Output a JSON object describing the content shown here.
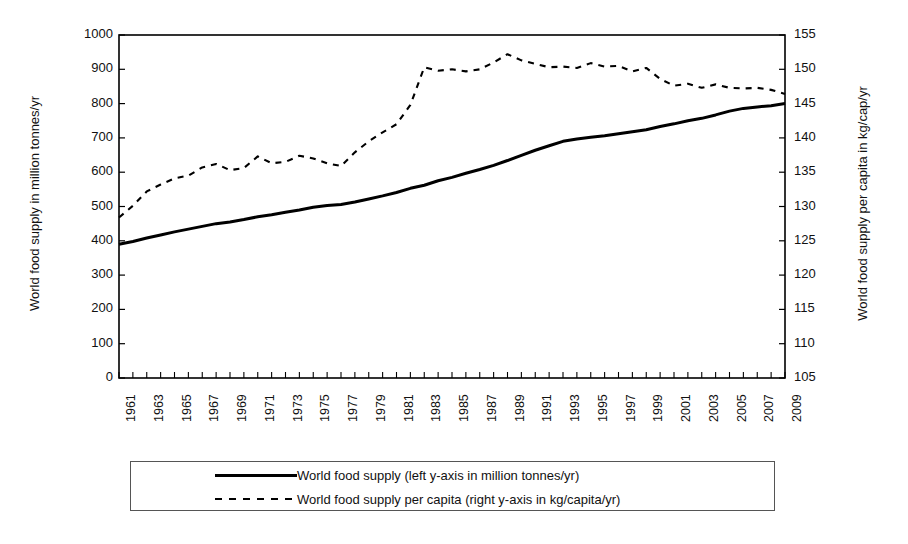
{
  "chart_data": {
    "type": "line",
    "title": "",
    "xlabel": "",
    "x": [
      1961,
      1962,
      1963,
      1964,
      1965,
      1966,
      1967,
      1968,
      1969,
      1970,
      1971,
      1972,
      1973,
      1974,
      1975,
      1976,
      1977,
      1978,
      1979,
      1980,
      1981,
      1982,
      1983,
      1984,
      1985,
      1986,
      1987,
      1988,
      1989,
      1990,
      1991,
      1992,
      1993,
      1994,
      1995,
      1996,
      1997,
      1998,
      1999,
      2000,
      2001,
      2002,
      2003,
      2004,
      2005,
      2006,
      2007,
      2008,
      2009
    ],
    "xtick_labels": [
      "1961",
      "1963",
      "1965",
      "1967",
      "1969",
      "1971",
      "1973",
      "1975",
      "1977",
      "1979",
      "1981",
      "1983",
      "1985",
      "1987",
      "1989",
      "1991",
      "1993",
      "1995",
      "1997",
      "1999",
      "2001",
      "2003",
      "2005",
      "2007",
      "2009"
    ],
    "xlim": [
      1961,
      2009
    ],
    "grid": false,
    "legend_position": "below-plot",
    "axes": [
      {
        "id": "left",
        "ylabel": "World food supply in million tonnes/yr",
        "ylim": [
          0,
          1000
        ],
        "yticks": [
          0,
          100,
          200,
          300,
          400,
          500,
          600,
          700,
          800,
          900,
          1000
        ]
      },
      {
        "id": "right",
        "ylabel": "World food supply per capita in kg/cap/yr",
        "ylim": [
          105,
          155
        ],
        "yticks": [
          105,
          110,
          115,
          120,
          125,
          130,
          135,
          140,
          145,
          150,
          155
        ]
      }
    ],
    "series": [
      {
        "name": "World food supply (left y-axis in million tonnes/yr)",
        "axis": "left",
        "style": "solid",
        "color": "#000000",
        "values": [
          390,
          398,
          408,
          417,
          426,
          434,
          442,
          450,
          455,
          462,
          470,
          476,
          483,
          490,
          498,
          503,
          506,
          513,
          522,
          531,
          541,
          553,
          562,
          575,
          585,
          597,
          608,
          620,
          634,
          649,
          664,
          677,
          690,
          697,
          702,
          706,
          712,
          718,
          724,
          733,
          741,
          750,
          757,
          767,
          778,
          786,
          790,
          794,
          800
        ]
      },
      {
        "name": "World food supply per capita (right y-axis in kg/capita/yr)",
        "axis": "right",
        "style": "dashed",
        "color": "#000000",
        "values": [
          128.4,
          130.1,
          132.2,
          133.2,
          134.1,
          134.5,
          135.7,
          136.2,
          135.3,
          135.6,
          137.3,
          136.3,
          136.5,
          137.4,
          137.0,
          136.3,
          135.9,
          137.9,
          139.5,
          140.8,
          142.0,
          144.8,
          150.3,
          149.8,
          150.0,
          149.7,
          150.0,
          151.0,
          152.2,
          151.3,
          150.8,
          150.3,
          150.4,
          150.2,
          150.9,
          150.4,
          150.5,
          149.7,
          150.2,
          148.6,
          147.6,
          147.9,
          147.3,
          147.8,
          147.3,
          147.2,
          147.3,
          147.0,
          146.4
        ]
      }
    ]
  },
  "legend": {
    "items": [
      {
        "style": "solid",
        "label": "World food supply (left y-axis in million tonnes/yr)"
      },
      {
        "style": "dashed",
        "label": "World food supply per capita (right y-axis in kg/capita/yr)"
      }
    ]
  }
}
